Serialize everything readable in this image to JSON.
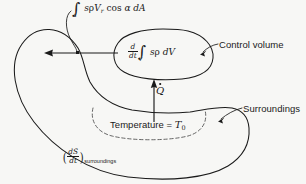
{
  "figure": {
    "background_color": "#f7f7f5",
    "line_color": "#1a1a1a"
  },
  "labels": {
    "entropy_flux": {
      "name": "entropy-flux-integral",
      "integral_limit": "A",
      "integrand_pre": "s",
      "rho": "ρ",
      "velocity": "V",
      "velocity_sub": "r",
      "cos": "cos",
      "alpha": "α",
      "differential": "dA",
      "plain": "∫_A sρV_r cos α dA"
    },
    "control_volume_rate": {
      "name": "control-volume-entropy-rate",
      "frac_num": "d",
      "frac_den": "dt",
      "integral_limit": "V",
      "integrand": "s",
      "rho": "ρ",
      "differential": "dV",
      "plain": "d/dt ∫_V sρ dV"
    },
    "control_volume": "Control volume",
    "surroundings": "Surroundings",
    "heat_rate": {
      "name": "heat-transfer-rate",
      "symbol": "Q",
      "plain": "Q̇"
    },
    "temperature": {
      "name": "surroundings-temperature",
      "text": "Temperature = ",
      "symbol": "T",
      "subscript": "0",
      "plain": "Temperature = T₀"
    },
    "entropy_surroundings": {
      "name": "surroundings-entropy-rate",
      "frac_num": "dS",
      "frac_den": "dt",
      "subscript": "surroundings",
      "open_paren": "(",
      "close_paren": ")",
      "plain": "(dS/dt)_surroundings"
    }
  },
  "shapes": {
    "outer_boundary": "surroundings-boundary",
    "control_volume_blob": "control-volume-boundary",
    "dashed_region": "temperature-region-dashed",
    "flux_arrow": "entropy-flux-arrow",
    "heat_arrow": "heat-flow-arrow",
    "cv_leader": "control-volume-leader-arrow",
    "surr_leader": "surroundings-leader-arrow",
    "flux_leader": "entropy-flux-leader"
  }
}
